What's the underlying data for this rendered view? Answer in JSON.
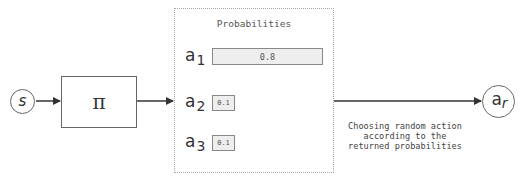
{
  "diagram": {
    "state_node": {
      "label": "s"
    },
    "policy_node": {
      "label": "π"
    },
    "probabilities_box": {
      "title": "Probabilities",
      "actions": [
        {
          "label": "a",
          "subscript": "1",
          "probability": "0.8",
          "value": 0.8
        },
        {
          "label": "a",
          "subscript": "2",
          "probability": "0.1",
          "value": 0.1
        },
        {
          "label": "a",
          "subscript": "3",
          "probability": "0.1",
          "value": 0.1
        }
      ]
    },
    "output_node": {
      "label": "a",
      "subscript": "r"
    },
    "edge_caption": {
      "line1": "Choosing random action",
      "line2": "according to the",
      "line3": "returned probabilities"
    },
    "colors": {
      "stroke": "#666666",
      "arrow": "#333333",
      "bar_fill": "#eeeeee",
      "dashed_border": "#aaaaaa"
    }
  }
}
